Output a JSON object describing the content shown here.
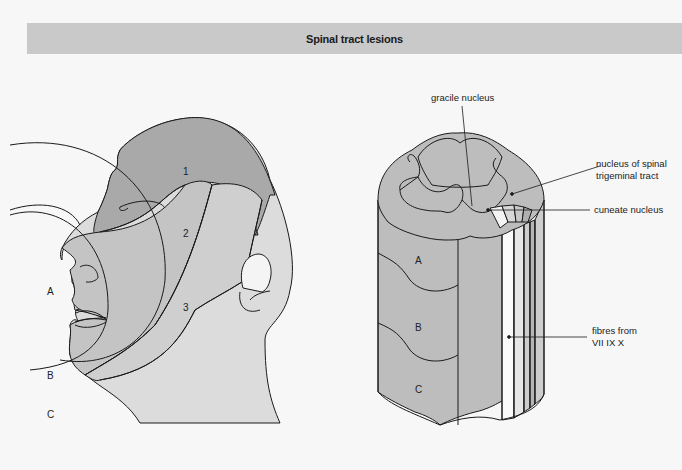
{
  "title": "Spinal tract lesions",
  "head_diagram": {
    "zone_labels": [
      "1",
      "2",
      "3"
    ],
    "ring_labels": [
      "A",
      "B",
      "C"
    ]
  },
  "cord_diagram": {
    "segment_labels": [
      "A",
      "B",
      "C"
    ],
    "annotations": {
      "gracile": "gracile nucleus",
      "spinal_trigeminal_1": "nucleus of spinal",
      "spinal_trigeminal_2": "trigeminal tract",
      "cuneate": "cuneate nucleus",
      "fibres_1": "fibres from",
      "fibres_2": "VII IX X"
    }
  },
  "colors": {
    "title_bar": "#c9c9c9",
    "zone_dark": "#a9a9a9",
    "zone_mid": "#c4c4c4",
    "zone_light": "#dcdcdc",
    "cord": "#bdbdbd"
  }
}
